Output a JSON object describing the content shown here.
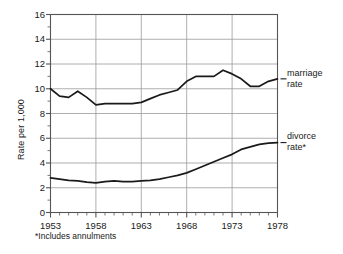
{
  "chart_data": {
    "type": "line",
    "title": "",
    "xlabel": "",
    "ylabel": "Rate per 1,000",
    "xlim": [
      1953,
      1978
    ],
    "ylim": [
      0,
      16
    ],
    "ytick_step": 2,
    "xtick_step": 5,
    "minor_xtick_step": 1,
    "grid": true,
    "legend_position": "right-inline",
    "footnote": "*Includes annulments",
    "ytick_labels": [
      "0",
      "2",
      "4",
      "6",
      "8",
      "10",
      "12",
      "14",
      "16"
    ],
    "xtick_labels": [
      "1953",
      "1958",
      "1963",
      "1968",
      "1973",
      "1978"
    ],
    "x": [
      1953,
      1954,
      1955,
      1956,
      1957,
      1958,
      1959,
      1960,
      1961,
      1962,
      1963,
      1964,
      1965,
      1966,
      1967,
      1968,
      1969,
      1970,
      1971,
      1972,
      1973,
      1974,
      1975,
      1976,
      1977,
      1978
    ],
    "series": [
      {
        "name": "marriage rate",
        "label": "marriage\nrate",
        "label_line1": "marriage",
        "label_line2": "rate",
        "color": "#1a1a1a",
        "values": [
          10.0,
          9.4,
          9.3,
          9.8,
          9.3,
          8.7,
          8.8,
          8.8,
          8.8,
          8.8,
          8.9,
          9.2,
          9.5,
          9.7,
          9.9,
          10.6,
          11.0,
          11.0,
          11.0,
          11.5,
          11.2,
          10.8,
          10.2,
          10.2,
          10.6,
          10.8
        ]
      },
      {
        "name": "divorce rate",
        "label": "divorce\nrate*",
        "label_line1": "divorce",
        "label_line2": "rate*",
        "color": "#1a1a1a",
        "values": [
          2.8,
          2.7,
          2.6,
          2.55,
          2.45,
          2.4,
          2.5,
          2.55,
          2.5,
          2.5,
          2.55,
          2.6,
          2.7,
          2.85,
          3.0,
          3.2,
          3.5,
          3.8,
          4.1,
          4.4,
          4.7,
          5.1,
          5.3,
          5.5,
          5.6,
          5.65
        ]
      }
    ]
  }
}
